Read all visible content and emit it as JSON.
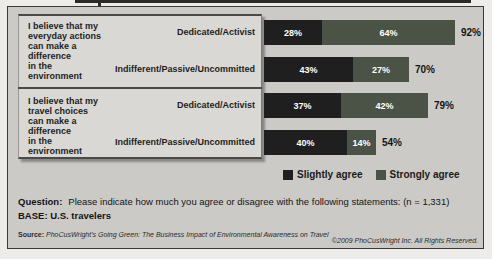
{
  "chart_data": {
    "type": "bar",
    "orientation": "horizontal",
    "stacked": true,
    "unit": "percent",
    "xlim": [
      0,
      100
    ],
    "grid": false,
    "legend_position": "bottom",
    "series": [
      {
        "name": "Slightly agree",
        "color": "#1f1f1f"
      },
      {
        "name": "Strongly agree",
        "color": "#4b5346"
      }
    ],
    "groups": [
      {
        "statement": "I believe that my everyday actions can make a difference in the environment",
        "statement_lines": [
          "I believe that my",
          "everyday actions",
          "can make a",
          "difference",
          "in the",
          "environment"
        ],
        "rows": [
          {
            "category": "Dedicated/Activist",
            "values": [
              28,
              64
            ],
            "labels": [
              "28%",
              "64%"
            ],
            "total": 92,
            "total_label": "92%"
          },
          {
            "category": "Indifferent/Passive/Uncommitted",
            "values": [
              43,
              27
            ],
            "labels": [
              "43%",
              "27%"
            ],
            "total": 70,
            "total_label": "70%"
          }
        ]
      },
      {
        "statement": "I believe that my travel choices can make a difference in the environment",
        "statement_lines": [
          "I believe that my",
          "travel choices",
          "can make a",
          "difference",
          "in the",
          "environment"
        ],
        "rows": [
          {
            "category": "Dedicated/Activist",
            "values": [
              37,
              42
            ],
            "labels": [
              "37%",
              "42%"
            ],
            "total": 79,
            "total_label": "79%"
          },
          {
            "category": "Indifferent/Passive/Uncommitted",
            "values": [
              40,
              14
            ],
            "labels": [
              "40%",
              "14%"
            ],
            "total": 54,
            "total_label": "54%"
          }
        ]
      }
    ],
    "legend": [
      "Slightly agree",
      "Strongly agree"
    ]
  },
  "footer": {
    "question_label": "Question:",
    "question_text": "Please indicate how much you agree or disagree with the following statements: (n = 1,331)",
    "base_text": "BASE: U.S. travelers",
    "source_label": "Source:",
    "source_text": "PhoCusWright's Going Green: The Business Impact of Environmental Awareness on Travel",
    "copyright": "©2009 PhoCusWright Inc. All Rights Reserved."
  },
  "colors": {
    "slightly_agree": "#1f1f1f",
    "strongly_agree": "#4b5346",
    "chart_background": "#cbcac7",
    "panel_background": "#d9d8d4"
  }
}
